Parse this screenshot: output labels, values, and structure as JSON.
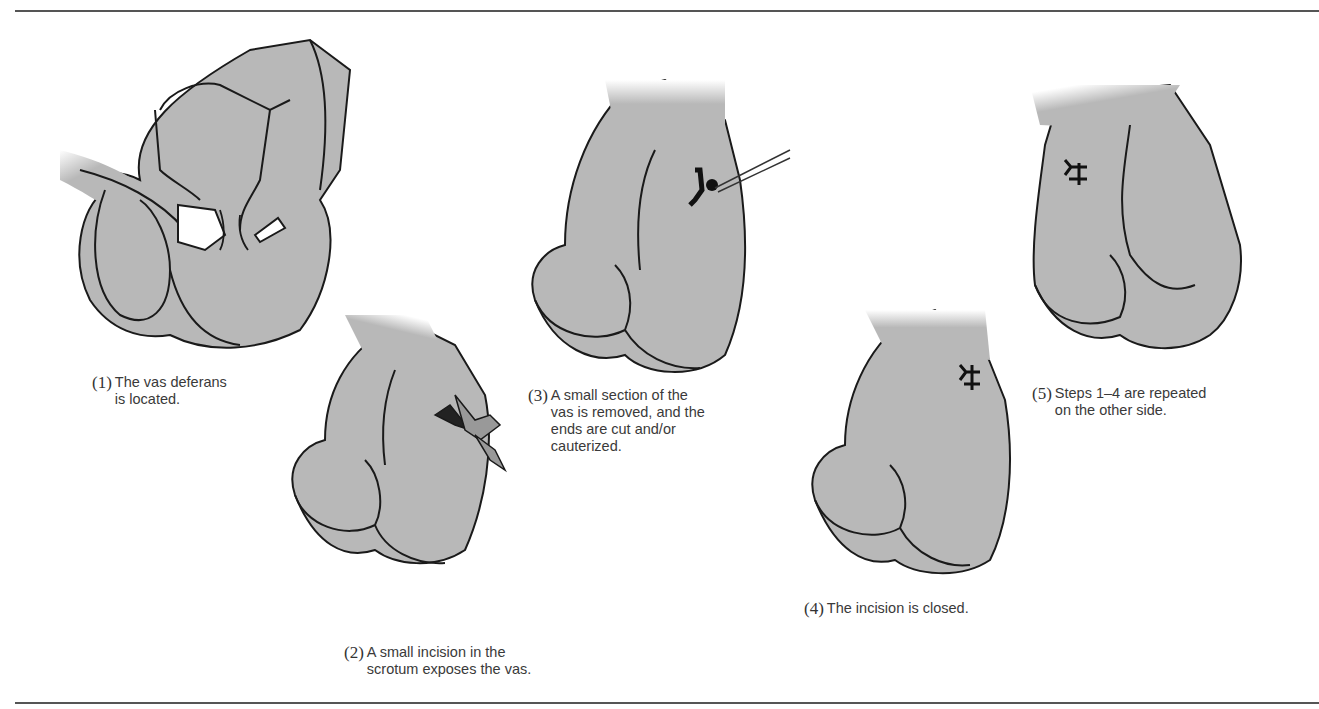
{
  "diagram": {
    "title": "",
    "colors": {
      "skin_fill": "#b8b8b8",
      "outline": "#1a1a1a",
      "rule": "#555555",
      "text": "#3a3a3a"
    },
    "steps": [
      {
        "number": "(1)",
        "lines": [
          "The vas deferans",
          "is located."
        ],
        "icon": "hand-pinching-scrotum-icon"
      },
      {
        "number": "(2)",
        "lines": [
          "A small incision in the",
          "scrotum exposes the vas."
        ],
        "icon": "scissors-incision-icon"
      },
      {
        "number": "(3)",
        "lines": [
          "A small section of the",
          "vas is removed, and the",
          "ends are cut and/or",
          "cauterized."
        ],
        "icon": "forceps-cauterize-icon"
      },
      {
        "number": "(4)",
        "lines": [
          "The incision is closed."
        ],
        "icon": "sutures-icon"
      },
      {
        "number": "(5)",
        "lines": [
          "Steps 1–4 are repeated",
          "on the other side."
        ],
        "icon": "sutures-icon"
      }
    ]
  }
}
